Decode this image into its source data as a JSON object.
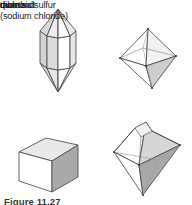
{
  "figure": {
    "caption": "Figure 11.27",
    "background_color": "#ffffff",
    "outline_color": "#4a4a4a",
    "items": [
      {
        "id": "quartz",
        "label": "quartz",
        "shape": "hexagonal-prism-with-pyramidal-terminations",
        "fill_light": "#ffffff",
        "fill_mid": "#e3e3e3",
        "fill_dark": "#c9c9c9"
      },
      {
        "id": "diamond",
        "label": "diamond",
        "shape": "octahedron",
        "fill_light": "#ffffff",
        "fill_mid": "#ececec",
        "fill_dark": "#cfcfcf"
      },
      {
        "id": "table-salt",
        "label_line1": "table salt",
        "label_line2": "(sodium chloride)",
        "label": "table salt\n(sodium chloride)",
        "shape": "cube",
        "fill_light": "#ffffff",
        "fill_mid": "#e8e8e8",
        "fill_dark": "#a9a9a9"
      },
      {
        "id": "rhombic-sulfur",
        "label": "rhombic sulfur",
        "shape": "rhombic-dipyramid",
        "fill_light": "#ffffff",
        "fill_mid": "#dcdcdc",
        "fill_dark": "#a8a8a8"
      }
    ]
  }
}
